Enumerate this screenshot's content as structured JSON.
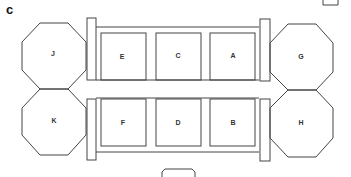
{
  "panel_label": "c",
  "octagons": [
    {
      "id": "J",
      "label": "J",
      "cx": 53,
      "cy": 53
    },
    {
      "id": "K",
      "label": "K",
      "cx": 53,
      "cy": 121
    },
    {
      "id": "G",
      "label": "G",
      "cx": 300,
      "cy": 57
    },
    {
      "id": "H",
      "label": "H",
      "cx": 300,
      "cy": 123
    }
  ],
  "boxes_top": [
    {
      "label": "E"
    },
    {
      "label": "C"
    },
    {
      "label": "A"
    }
  ],
  "boxes_bottom": [
    {
      "label": "F"
    },
    {
      "label": "D"
    },
    {
      "label": "B"
    }
  ],
  "colors": {
    "stroke": "#444444",
    "background": "#ffffff"
  }
}
